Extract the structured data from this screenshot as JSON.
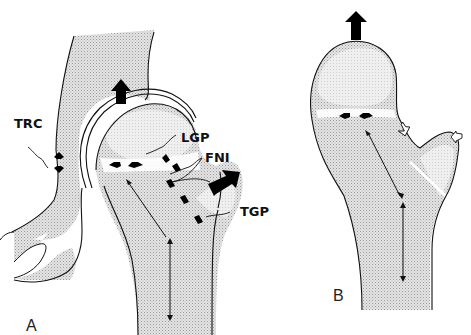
{
  "figure": {
    "panels": [
      {
        "id": "A",
        "label": "A",
        "description": "Hip joint with pelvis (acetabulum) and proximal femur showing growth plates and force arrows"
      },
      {
        "id": "B",
        "label": "B",
        "description": "Isolated proximal femur showing growth plates and force arrows"
      }
    ],
    "labels": {
      "trc": "TRC",
      "lgp": "LGP",
      "fni": "FNI",
      "tgp": "TGP"
    },
    "colors": {
      "bone_fill": "#dcdcdc",
      "stipple": "#b9b9b9",
      "outline": "#111111",
      "arrow": "#000000",
      "background": "#ffffff"
    }
  }
}
